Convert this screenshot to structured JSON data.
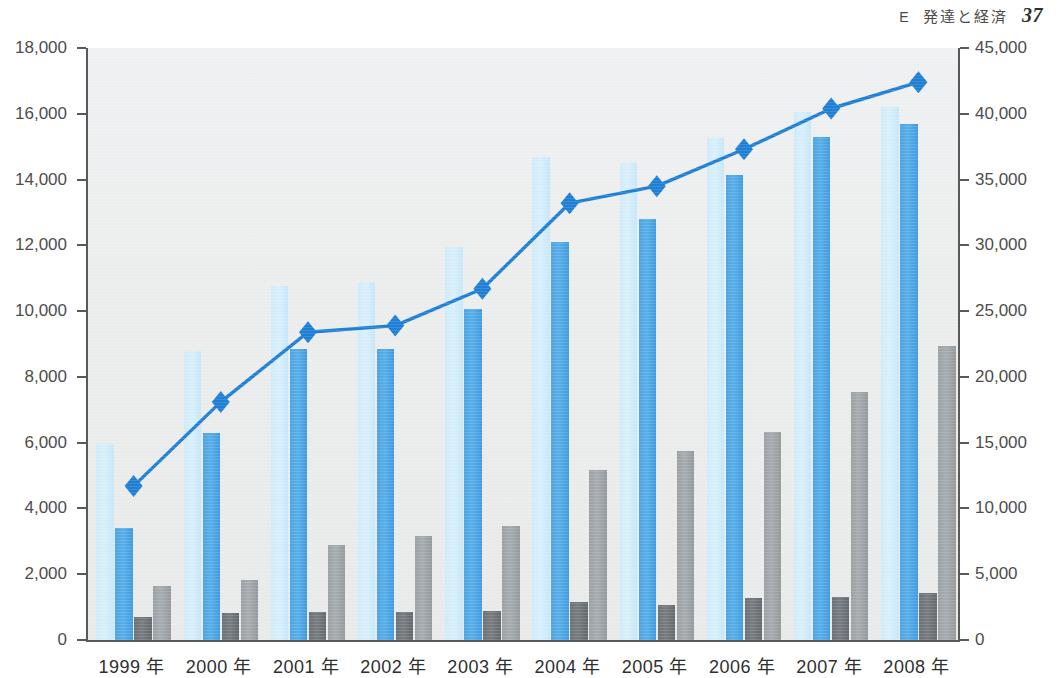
{
  "runninghead": {
    "section": "E",
    "title": "発達と経済",
    "page": "37"
  },
  "chart_data": {
    "type": "bar",
    "title": "",
    "subtitle": "",
    "xlabel": "",
    "ylabel": "",
    "grid": false,
    "legend_position": "none",
    "categories": [
      "1999 年",
      "2000 年",
      "2001 年",
      "2002 年",
      "2003 年",
      "2004 年",
      "2005 年",
      "2006 年",
      "2007 年",
      "2008 年"
    ],
    "y_axis_left": {
      "min": 0,
      "max": 18000,
      "step": 2000,
      "ticks": [
        "0",
        "2,000",
        "4,000",
        "6,000",
        "8,000",
        "10,000",
        "12,000",
        "14,000",
        "16,000",
        "18,000"
      ]
    },
    "y_axis_right": {
      "min": 0,
      "max": 45000,
      "step": 5000,
      "ticks": [
        "0",
        "5,000",
        "10,000",
        "15,000",
        "20,000",
        "25,000",
        "30,000",
        "35,000",
        "40,000",
        "45,000"
      ]
    },
    "series": [
      {
        "name": "series-light-blue",
        "axis": "left",
        "type": "bar",
        "color": "#d3edfa",
        "values": [
          5950,
          8800,
          10750,
          10900,
          11950,
          14700,
          14500,
          15250,
          16050,
          16200
        ]
      },
      {
        "name": "series-blue",
        "axis": "left",
        "type": "bar",
        "color": "#4da6e6",
        "values": [
          3400,
          6300,
          8850,
          8850,
          10050,
          12100,
          12800,
          14150,
          15300,
          15700
        ]
      },
      {
        "name": "series-dark-gray",
        "axis": "left",
        "type": "bar",
        "color": "#70757a",
        "values": [
          700,
          820,
          860,
          840,
          870,
          1150,
          1050,
          1270,
          1320,
          1440
        ]
      },
      {
        "name": "series-gray",
        "axis": "left",
        "type": "bar",
        "color": "#9ea3a8",
        "values": [
          1650,
          1820,
          2880,
          3150,
          3480,
          5180,
          5750,
          6330,
          7530,
          8950
        ]
      },
      {
        "name": "series-line",
        "axis": "right",
        "type": "line",
        "color": "#1f7fd4",
        "marker": "diamond",
        "values": [
          11700,
          18100,
          23400,
          23900,
          26700,
          33200,
          34500,
          37300,
          40400,
          42400
        ]
      }
    ]
  }
}
